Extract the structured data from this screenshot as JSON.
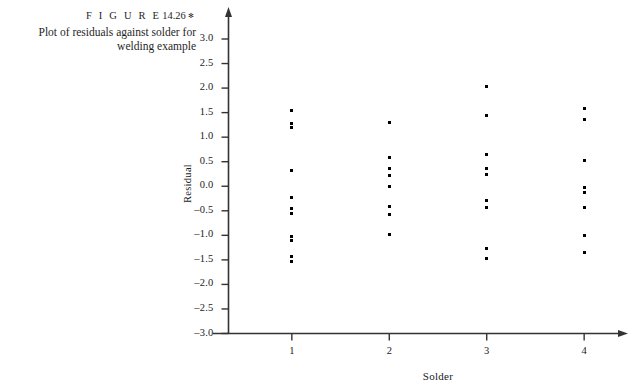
{
  "caption": {
    "figure_word": "F I G U R E",
    "figure_number": "14.26",
    "bullet": "✻",
    "text": "Plot of residuals against solder for welding example"
  },
  "chart_data": {
    "type": "scatter",
    "title": "",
    "xlabel": "Solder",
    "ylabel": "Residual",
    "xlim": [
      0.35,
      4.45
    ],
    "ylim": [
      -3.0,
      3.0
    ],
    "grid": false,
    "legend": null,
    "x_ticks": [
      "1",
      "2",
      "3",
      "4"
    ],
    "x_tick_values": [
      1,
      2,
      3,
      4
    ],
    "y_ticks": [
      "3.0",
      "2.5",
      "2.0",
      "1.5",
      "1.0",
      "0.5",
      "0.0",
      "–0.5",
      "–1.0",
      "–1.5",
      "–2.0",
      "–2.5",
      "–3.0"
    ],
    "y_tick_values": [
      3.0,
      2.5,
      2.0,
      1.5,
      1.0,
      0.5,
      0.0,
      -0.5,
      -1.0,
      -1.5,
      -2.0,
      -2.5,
      -3.0
    ],
    "series": [
      {
        "name": "Solder 1",
        "x": 1,
        "values": [
          1.55,
          1.28,
          1.2,
          0.33,
          -0.22,
          -0.45,
          -0.56,
          -1.02,
          -1.1,
          -1.43,
          -1.53
        ]
      },
      {
        "name": "Solder 2",
        "x": 2,
        "values": [
          1.3,
          0.58,
          0.37,
          0.22,
          0.0,
          -0.42,
          -0.57,
          -0.99
        ]
      },
      {
        "name": "Solder 3",
        "x": 3,
        "values": [
          2.03,
          1.44,
          0.64,
          0.37,
          0.23,
          -0.3,
          -0.43,
          -1.27,
          -1.47
        ]
      },
      {
        "name": "Solder 4",
        "x": 4,
        "values": [
          1.59,
          1.37,
          0.53,
          -0.02,
          -0.13,
          -0.43,
          -1.0,
          -1.35
        ]
      }
    ],
    "axis_style": {
      "arrow_ends": true,
      "line_color": "#333333",
      "marker_color": "#000000",
      "marker_shape": "square"
    }
  }
}
